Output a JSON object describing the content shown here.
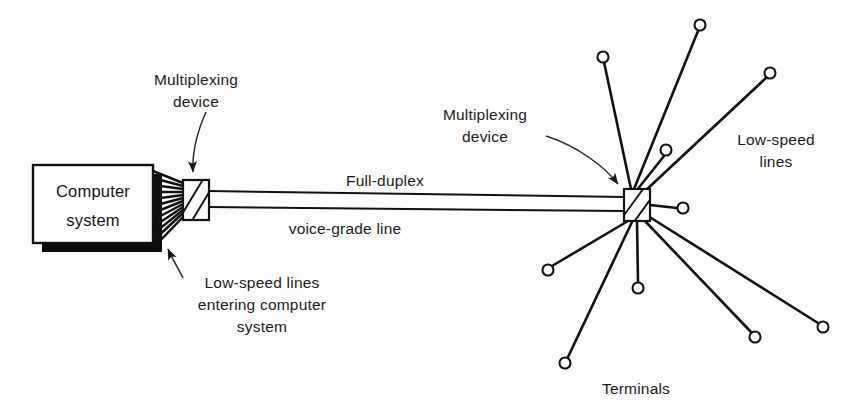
{
  "figure": {
    "background_color": "#fefefe",
    "ink_color": "#111111"
  },
  "nodes": {
    "computer_system": {
      "label_line1": "Computer",
      "label_line2": "system",
      "shape": "rectangle-with-drop-shadow",
      "x": 33,
      "y": 165,
      "width": 120,
      "height": 78
    },
    "multiplexer_left": {
      "name": "multiplexing-device-left",
      "shape": "hatched-rectangle",
      "x": 183,
      "y": 180,
      "width": 26,
      "height": 40
    },
    "multiplexer_right": {
      "name": "multiplexing-device-right",
      "shape": "hatched-rectangle",
      "x": 624,
      "y": 189,
      "width": 26,
      "height": 32
    }
  },
  "labels": {
    "multiplexing_device_left": {
      "line1": "Multiplexing",
      "line2": "device",
      "x": 196,
      "y": 78
    },
    "multiplexing_device_right": {
      "line1": "Multiplexing",
      "line2": "device",
      "x": 466,
      "y": 113
    },
    "trunk_upper": {
      "text": "Full-duplex",
      "x": 332,
      "y": 180
    },
    "trunk_lower": {
      "text": "voice-grade line",
      "x": 281,
      "y": 228
    },
    "low_speed_entering": {
      "line1": "Low-speed lines",
      "line2": "entering computer",
      "line3": "system",
      "x": 174,
      "y": 281
    },
    "low_speed_lines_right": {
      "line1": "Low-speed",
      "line2": "lines",
      "x": 729,
      "y": 138
    },
    "terminals": {
      "text": "Terminals",
      "x": 592,
      "y": 387
    }
  },
  "trunk": {
    "description": "Full-duplex voice-grade line: two parallel lines between multiplexers",
    "start_x": 209,
    "end_x": 624,
    "upper_y_start": 192,
    "upper_y_end": 198,
    "lower_y_start": 206,
    "lower_y_end": 211
  },
  "fan_lines": {
    "description": "Low-speed lines entering computer system",
    "count": 12,
    "box_edge_x": 153,
    "mux_x": 183,
    "box_top_y": 171,
    "box_bottom_y": 248,
    "mux_top_y": 182,
    "mux_bottom_y": 219
  },
  "terminal_spokes": [
    {
      "id": 1,
      "cx": 603,
      "cy": 57,
      "r": 5.5,
      "label": "terminal"
    },
    {
      "id": 2,
      "cx": 700,
      "cy": 25,
      "r": 5.5,
      "label": "terminal"
    },
    {
      "id": 3,
      "cx": 666,
      "cy": 150,
      "r": 5.5,
      "label": "terminal"
    },
    {
      "id": 4,
      "cx": 770,
      "cy": 73,
      "r": 5.5,
      "label": "terminal"
    },
    {
      "id": 5,
      "cx": 683,
      "cy": 208,
      "r": 5.5,
      "label": "terminal"
    },
    {
      "id": 6,
      "cx": 548,
      "cy": 270,
      "r": 5.5,
      "label": "terminal"
    },
    {
      "id": 7,
      "cx": 565,
      "cy": 363,
      "r": 5.5,
      "label": "terminal"
    },
    {
      "id": 8,
      "cx": 638,
      "cy": 288,
      "r": 5.5,
      "label": "terminal"
    },
    {
      "id": 9,
      "cx": 755,
      "cy": 337,
      "r": 5.5,
      "label": "terminal"
    },
    {
      "id": 10,
      "cx": 823,
      "cy": 327,
      "r": 5.5,
      "label": "terminal"
    }
  ],
  "leaders": [
    {
      "name": "leader-mux-left",
      "from": "Multiplexing device (left)",
      "to": "multiplexer-left"
    },
    {
      "name": "leader-mux-right",
      "from": "Multiplexing device (right)",
      "to": "multiplexer-right"
    },
    {
      "name": "leader-low-speed",
      "from": "Low-speed lines entering computer system",
      "to": "fan-lines"
    }
  ]
}
